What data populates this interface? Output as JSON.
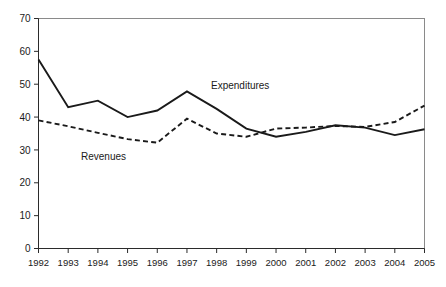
{
  "chart_data": {
    "type": "line",
    "title": "",
    "xlabel": "",
    "ylabel": "",
    "categories": [
      "1992",
      "1993",
      "1994",
      "1995",
      "1996",
      "1997",
      "1998",
      "1999",
      "2000",
      "2001",
      "2002",
      "2003",
      "2004",
      "2005"
    ],
    "xlim": [
      "1992",
      "2005"
    ],
    "ylim": [
      0,
      70
    ],
    "ytick_labels": [
      "0",
      "10",
      "20",
      "30",
      "40",
      "50",
      "60",
      "70"
    ],
    "ytick_values": [
      0,
      10,
      20,
      30,
      40,
      50,
      60,
      70
    ],
    "grid": false,
    "legend_position": "inline-annotations",
    "series": [
      {
        "name": "Expenditures",
        "style": "solid",
        "color": "#1a1a1a",
        "label_x": "1997",
        "values": [
          57.5,
          43.0,
          45.0,
          40.0,
          42.0,
          47.8,
          42.5,
          36.5,
          34.0,
          35.5,
          37.5,
          36.8,
          34.5,
          36.3
        ]
      },
      {
        "name": "Revenues",
        "style": "dashed",
        "color": "#1a1a1a",
        "label_x": "1995",
        "values": [
          39.0,
          37.2,
          35.2,
          33.3,
          32.2,
          39.5,
          35.0,
          34.0,
          36.5,
          36.8,
          37.3,
          37.0,
          38.5,
          43.5
        ]
      }
    ],
    "annotations": [
      {
        "text": "Expenditures",
        "x_px": 211,
        "y_px": 89
      },
      {
        "text": "Revenues",
        "x_px": 81,
        "y_px": 160
      }
    ]
  },
  "axes": {
    "y_axis_name": "value-axis",
    "x_axis_name": "year-axis"
  }
}
